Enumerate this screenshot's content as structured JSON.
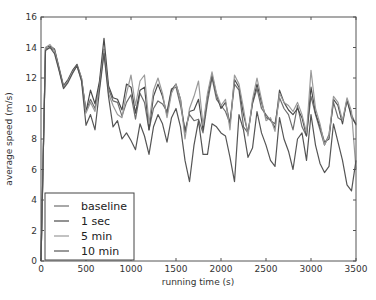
{
  "chart_data": {
    "type": "line",
    "title": "",
    "xlabel": "running time (s)",
    "ylabel": "average speed (m/s)",
    "xlim": [
      0,
      3500
    ],
    "ylim": [
      0,
      16
    ],
    "xticks": [
      0,
      500,
      1000,
      1500,
      2000,
      2500,
      3000,
      3500
    ],
    "yticks": [
      0,
      2,
      4,
      6,
      8,
      10,
      12,
      14,
      16
    ],
    "grid": false,
    "legend_position": "lower left",
    "x": [
      0,
      50,
      100,
      150,
      200,
      250,
      300,
      350,
      400,
      450,
      500,
      550,
      600,
      650,
      700,
      750,
      800,
      850,
      900,
      950,
      1000,
      1050,
      1100,
      1150,
      1200,
      1250,
      1300,
      1350,
      1400,
      1450,
      1500,
      1550,
      1600,
      1650,
      1700,
      1750,
      1800,
      1850,
      1900,
      1950,
      2000,
      2050,
      2100,
      2150,
      2200,
      2250,
      2300,
      2350,
      2400,
      2450,
      2500,
      2550,
      2600,
      2650,
      2700,
      2750,
      2800,
      2850,
      2900,
      2950,
      3000,
      3050,
      3100,
      3150,
      3200,
      3250,
      3300,
      3350,
      3400,
      3450,
      3500
    ],
    "series": [
      {
        "name": "baseline",
        "color": "#6e6e6e",
        "values": [
          0,
          13.9,
          14.0,
          13.8,
          12.6,
          11.4,
          11.8,
          12.4,
          12.8,
          11.9,
          9.8,
          10.6,
          10.0,
          11.6,
          13.9,
          11.3,
          10.5,
          10.4,
          9.5,
          10.4,
          10.9,
          9.3,
          11.0,
          10.4,
          8.6,
          10.0,
          10.5,
          10.3,
          9.8,
          11.3,
          11.4,
          10.2,
          8.6,
          9.6,
          9.2,
          9.3,
          8.4,
          10.4,
          12.0,
          10.6,
          10.2,
          9.8,
          9.0,
          11.6,
          11.2,
          8.8,
          8.4,
          10.3,
          11.3,
          10.0,
          9.6,
          9.2,
          9.0,
          10.7,
          10.0,
          9.6,
          8.6,
          10.2,
          8.8,
          8.2,
          10.8,
          9.6,
          8.6,
          7.6,
          8.3,
          10.4,
          9.4,
          9.2,
          10.5,
          9.6,
          8.9
        ]
      },
      {
        "name": "1 sec",
        "color": "#4a4a4a",
        "values": [
          0,
          14.0,
          14.1,
          13.9,
          12.7,
          11.5,
          11.9,
          12.5,
          12.9,
          12.0,
          9.8,
          11.2,
          10.3,
          11.8,
          14.6,
          11.5,
          10.7,
          10.6,
          9.9,
          11.6,
          11.4,
          9.7,
          11.2,
          11.4,
          8.6,
          10.8,
          11.6,
          10.8,
          9.6,
          11.2,
          11.6,
          10.6,
          8.4,
          9.8,
          9.9,
          10.6,
          8.6,
          10.8,
          12.2,
          10.9,
          10.0,
          10.4,
          9.0,
          11.9,
          11.4,
          9.6,
          8.4,
          10.4,
          11.6,
          10.4,
          9.4,
          9.3,
          8.7,
          11.2,
          10.4,
          9.9,
          9.6,
          10.0,
          9.4,
          8.2,
          11.4,
          9.7,
          8.8,
          7.8,
          8.0,
          10.6,
          10.2,
          9.0,
          10.6,
          9.4,
          9.0
        ]
      },
      {
        "name": "5 min",
        "color": "#9a9a9a",
        "values": [
          0,
          14.0,
          14.2,
          13.8,
          12.6,
          11.4,
          11.8,
          12.4,
          12.8,
          12.0,
          9.7,
          10.4,
          9.8,
          11.4,
          13.8,
          11.0,
          10.2,
          9.6,
          9.4,
          11.0,
          12.2,
          10.2,
          11.8,
          12.2,
          9.0,
          11.2,
          12.0,
          11.0,
          9.4,
          11.0,
          11.6,
          10.6,
          8.0,
          10.0,
          10.8,
          11.8,
          8.9,
          11.0,
          12.4,
          11.0,
          10.2,
          10.6,
          8.6,
          12.2,
          11.6,
          10.0,
          8.2,
          10.6,
          12.0,
          10.6,
          9.2,
          9.4,
          8.5,
          11.0,
          10.4,
          10.2,
          9.8,
          10.4,
          9.6,
          8.4,
          12.5,
          10.0,
          9.0,
          7.6,
          8.2,
          10.8,
          10.4,
          9.2,
          10.7,
          9.8,
          6.0
        ]
      },
      {
        "name": "10 min",
        "color": "#555555",
        "values": [
          0,
          13.8,
          14.0,
          13.6,
          12.5,
          11.3,
          11.7,
          12.3,
          12.8,
          11.8,
          8.9,
          9.6,
          8.6,
          11.2,
          13.6,
          10.8,
          8.8,
          9.2,
          8.0,
          8.4,
          7.9,
          7.3,
          9.0,
          8.2,
          7.0,
          8.8,
          9.6,
          9.0,
          7.8,
          9.4,
          10.0,
          8.8,
          6.6,
          5.2,
          7.6,
          9.2,
          7.0,
          7.0,
          9.0,
          8.8,
          8.4,
          8.2,
          6.8,
          5.2,
          9.6,
          8.6,
          6.8,
          7.4,
          9.8,
          8.4,
          7.6,
          6.6,
          6.2,
          9.4,
          8.0,
          7.2,
          6.0,
          8.0,
          8.4,
          6.6,
          9.6,
          7.6,
          6.4,
          5.8,
          6.2,
          9.0,
          7.8,
          6.6,
          5.0,
          4.6,
          6.6
        ]
      }
    ]
  },
  "legend": {
    "items": [
      {
        "label": "baseline",
        "color": "#6e6e6e"
      },
      {
        "label": "1 sec",
        "color": "#4a4a4a"
      },
      {
        "label": "5 min",
        "color": "#9a9a9a"
      },
      {
        "label": "10 min",
        "color": "#555555"
      }
    ]
  }
}
